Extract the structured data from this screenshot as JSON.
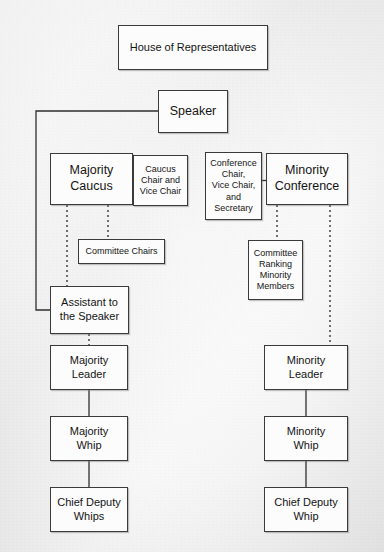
{
  "diagram": {
    "background_color": "#ececec",
    "node_fill_color": "#fcfcfc",
    "node_border_color": "#3a3a3a",
    "text_color": "#141414"
  },
  "nodes": {
    "house": {
      "label": "House of Representatives"
    },
    "speaker": {
      "label": "Speaker"
    },
    "majority_caucus": {
      "label": "Majority\nCaucus"
    },
    "caucus_officers": {
      "label": "Caucus\nChair and\nVice Chair"
    },
    "conference_officers": {
      "label": "Conference\nChair,\nVice Chair,\nand\nSecretary"
    },
    "minority_conference": {
      "label": "Minority\nConference"
    },
    "committee_chairs": {
      "label": "Committee Chairs"
    },
    "committee_ranking": {
      "label": "Committee\nRanking\nMinority\nMembers"
    },
    "assistant_speaker": {
      "label": "Assistant to\nthe Speaker"
    },
    "majority_leader": {
      "label": "Majority\nLeader"
    },
    "minority_leader": {
      "label": "Minority\nLeader"
    },
    "majority_whip": {
      "label": "Majority\nWhip"
    },
    "minority_whip": {
      "label": "Minority\nWhip"
    },
    "majority_chief_deputy": {
      "label": "Chief Deputy\nWhips"
    },
    "minority_chief_deputy": {
      "label": "Chief Deputy\nWhip"
    }
  },
  "connectors": [
    {
      "name": "speaker-to-assistant",
      "style": "solid",
      "from": "speaker",
      "to": "assistant_speaker"
    },
    {
      "name": "majority-caucus-to-officers",
      "style": "solid",
      "from": "majority_caucus",
      "to": "caucus_officers"
    },
    {
      "name": "conference-officers-to-minority-conference",
      "style": "solid",
      "from": "conference_officers",
      "to": "minority_conference"
    },
    {
      "name": "majority-caucus-to-assistant",
      "style": "dotted",
      "from": "majority_caucus",
      "to": "assistant_speaker"
    },
    {
      "name": "majority-caucus-to-committee-chairs",
      "style": "dotted",
      "from": "majority_caucus",
      "to": "committee_chairs"
    },
    {
      "name": "minority-conference-to-committee-ranking",
      "style": "dotted",
      "from": "minority_conference",
      "to": "committee_ranking"
    },
    {
      "name": "minority-conference-to-minority-leader",
      "style": "dotted",
      "from": "minority_conference",
      "to": "minority_leader"
    },
    {
      "name": "assistant-to-majority-leader",
      "style": "dotted",
      "from": "assistant_speaker",
      "to": "majority_leader"
    },
    {
      "name": "majority-leader-to-majority-whip",
      "style": "solid",
      "from": "majority_leader",
      "to": "majority_whip"
    },
    {
      "name": "majority-whip-to-chief-deputy-whips",
      "style": "solid",
      "from": "majority_whip",
      "to": "majority_chief_deputy"
    },
    {
      "name": "minority-leader-to-minority-whip",
      "style": "solid",
      "from": "minority_leader",
      "to": "minority_whip"
    },
    {
      "name": "minority-whip-to-chief-deputy-whip",
      "style": "solid",
      "from": "minority_whip",
      "to": "minority_chief_deputy"
    }
  ]
}
